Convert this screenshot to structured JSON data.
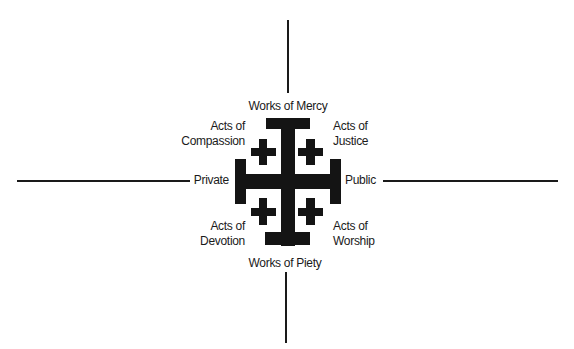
{
  "diagram": {
    "type": "jerusalem-cross-quadrant",
    "axes": {
      "vertical_top": "Works of Mercy",
      "vertical_bottom": "Works of Piety",
      "horizontal_left": "Private",
      "horizontal_right": "Public"
    },
    "quadrants": {
      "top_left": {
        "line1": "Acts of",
        "line2": "Compassion"
      },
      "top_right": {
        "line1": "Acts of",
        "line2": "Justice"
      },
      "bottom_left": {
        "line1": "Acts of",
        "line2": "Devotion"
      },
      "bottom_right": {
        "line1": "Acts of",
        "line2": "Worship"
      }
    },
    "center_icon": "jerusalem-cross",
    "colors": {
      "ink": "#141414",
      "background": "#ffffff"
    }
  }
}
